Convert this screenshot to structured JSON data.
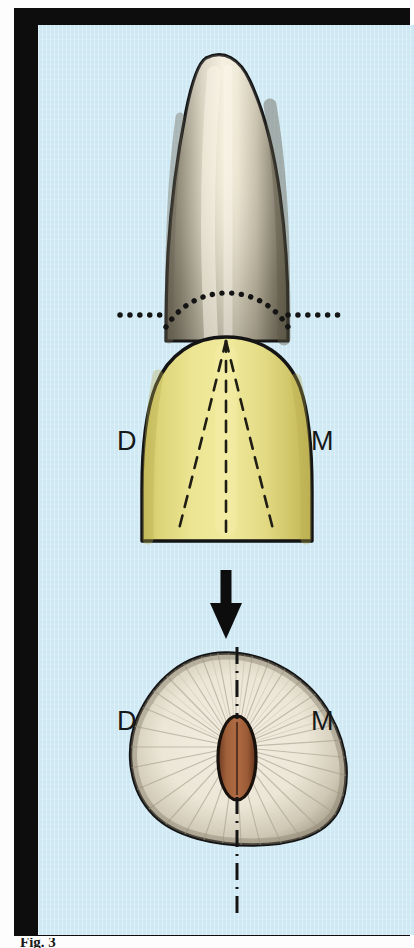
{
  "figure": {
    "domain": "anatomical-illustration",
    "frame_color": "#0d0d0d",
    "background_color": "#cfe9f4",
    "caption": "Fig. 3"
  },
  "labels": {
    "distal_crown": "D",
    "mesial_crown": "M",
    "distal_section": "D",
    "mesial_section": "M"
  },
  "upper_view": {
    "name": "tooth-labial-view",
    "root": {
      "name": "tooth-root",
      "fill_light": "#efeadb",
      "fill_shadow": "#85806f",
      "outline": "#141414"
    },
    "crown": {
      "name": "tooth-crown",
      "fill": "#e7e089",
      "fill_shade": "#cfc664",
      "outline": "#141414",
      "developmental_lines": 3
    },
    "cej_dotted_arc": {
      "name": "cementoenamel-junction-arc",
      "color": "#141414",
      "dot_count": 23
    },
    "reference_dotted_line": {
      "name": "horizontal-reference-line",
      "color": "#141414",
      "dot_count_left": 11,
      "dot_count_right": 11
    }
  },
  "section_arrow": {
    "name": "section-level-arrow",
    "color": "#0d0d0d",
    "direction": "down"
  },
  "lower_view": {
    "name": "root-cross-section",
    "dentin": {
      "fill_light": "#efeade",
      "fill_shadow": "#a49c8a",
      "outline": "#141414",
      "tubule_count": 44
    },
    "pulp_canal": {
      "name": "pulp-canal",
      "fill": "#a8613c",
      "fill_dark": "#6e3a21",
      "outline": "#1a1310",
      "shape": "narrow-oval"
    },
    "center_axis": {
      "name": "dash-dot-center-axis",
      "color": "#141414",
      "style": "dash-dot"
    }
  }
}
